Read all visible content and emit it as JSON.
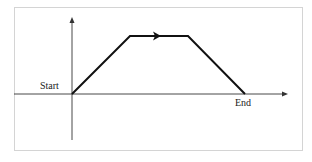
{
  "diagram": {
    "type": "trapezoid-path",
    "labels": {
      "start": "Start",
      "end": "End"
    },
    "axes": {
      "origin": [
        72,
        94
      ],
      "x_axis": {
        "from": [
          14,
          94
        ],
        "to": [
          287,
          94
        ],
        "arrow": true
      },
      "y_axis": {
        "from": [
          72,
          140
        ],
        "to": [
          72,
          18
        ],
        "arrow": true
      }
    },
    "path": {
      "points": [
        [
          72,
          94
        ],
        [
          130,
          36
        ],
        [
          188,
          36
        ],
        [
          245,
          94
        ]
      ],
      "direction_arrow_at": [
        158,
        36
      ],
      "stroke_color": "#111111"
    },
    "frame_color": "#d4d4d4",
    "axis_color": "#333333"
  }
}
